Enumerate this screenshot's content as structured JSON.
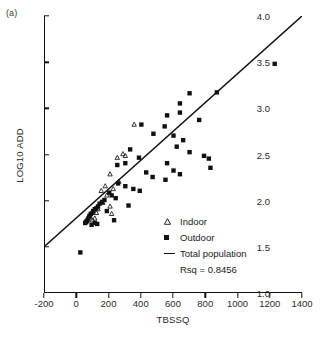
{
  "panel": {
    "label": "(a)"
  },
  "axes": {
    "xlabel": "TBSSQ",
    "ylabel": "LOG10 ADD",
    "xticks": [
      "-200",
      "0",
      "200",
      "400",
      "600",
      "800",
      "1000",
      "1200",
      "1400"
    ],
    "yticks": [
      "1.0",
      "1.5",
      "2.0",
      "2.5",
      "3.0",
      "3.5",
      "4.0"
    ]
  },
  "legend": {
    "indoor_label": "Indoor",
    "outdoor_label": "Outdoor",
    "total_label": "Total population",
    "rsq_label": "Rsq = 0.8456",
    "indoor_marker": "open-triangle-icon",
    "outdoor_marker": "filled-square-icon",
    "total_marker": "line-segment-icon"
  },
  "colors": {
    "axis": "#111111",
    "marker": "#111111",
    "background": "#ffffff"
  },
  "chart_data": {
    "type": "scatter",
    "title": "",
    "xlabel": "TBSSQ",
    "ylabel": "LOG10 ADD",
    "xlim": [
      -200,
      1400
    ],
    "ylim": [
      1.0,
      4.0
    ],
    "xticks": [
      -200,
      0,
      200,
      400,
      600,
      800,
      1000,
      1200,
      1400
    ],
    "yticks": [
      1.0,
      1.5,
      2.0,
      2.5,
      3.0,
      3.5,
      4.0
    ],
    "grid": false,
    "legend_position": "center-right",
    "annotations": [
      "(a)",
      "Rsq = 0.8456"
    ],
    "series": [
      {
        "name": "Indoor",
        "marker": "open-triangle",
        "points": [
          [
            355,
            2.82
          ],
          [
            250,
            2.46
          ],
          [
            285,
            2.5
          ],
          [
            300,
            2.48
          ],
          [
            205,
            2.28
          ],
          [
            175,
            2.15
          ],
          [
            260,
            2.2
          ],
          [
            225,
            2.12
          ],
          [
            150,
            2.1
          ],
          [
            185,
            2.05
          ],
          [
            160,
            1.97
          ],
          [
            205,
            1.93
          ],
          [
            130,
            1.9
          ],
          [
            120,
            1.86
          ],
          [
            215,
            1.85
          ],
          [
            110,
            1.8
          ],
          [
            95,
            1.78
          ]
        ]
      },
      {
        "name": "Outdoor",
        "marker": "filled-square",
        "points": [
          [
            1230,
            3.48
          ],
          [
            870,
            3.17
          ],
          [
            700,
            3.16
          ],
          [
            640,
            3.05
          ],
          [
            640,
            2.95
          ],
          [
            560,
            2.92
          ],
          [
            760,
            2.87
          ],
          [
            400,
            2.82
          ],
          [
            545,
            2.8
          ],
          [
            475,
            2.72
          ],
          [
            600,
            2.7
          ],
          [
            660,
            2.65
          ],
          [
            620,
            2.58
          ],
          [
            330,
            2.55
          ],
          [
            700,
            2.52
          ],
          [
            790,
            2.48
          ],
          [
            820,
            2.45
          ],
          [
            385,
            2.46
          ],
          [
            300,
            2.4
          ],
          [
            250,
            2.38
          ],
          [
            560,
            2.4
          ],
          [
            600,
            2.32
          ],
          [
            830,
            2.35
          ],
          [
            640,
            2.28
          ],
          [
            430,
            2.3
          ],
          [
            470,
            2.25
          ],
          [
            550,
            2.22
          ],
          [
            255,
            2.18
          ],
          [
            300,
            2.15
          ],
          [
            350,
            2.12
          ],
          [
            390,
            2.1
          ],
          [
            200,
            2.08
          ],
          [
            215,
            2.05
          ],
          [
            240,
            2.02
          ],
          [
            170,
            2.0
          ],
          [
            155,
            1.98
          ],
          [
            140,
            1.96
          ],
          [
            320,
            1.94
          ],
          [
            130,
            1.93
          ],
          [
            120,
            1.91
          ],
          [
            110,
            1.9
          ],
          [
            100,
            1.88
          ],
          [
            95,
            1.86
          ],
          [
            85,
            1.85
          ],
          [
            80,
            1.83
          ],
          [
            75,
            1.82
          ],
          [
            70,
            1.8
          ],
          [
            185,
            1.88
          ],
          [
            230,
            1.78
          ],
          [
            65,
            1.78
          ],
          [
            60,
            1.77
          ],
          [
            55,
            1.76
          ],
          [
            110,
            1.75
          ],
          [
            125,
            1.74
          ],
          [
            90,
            1.73
          ],
          [
            50,
            1.75
          ],
          [
            20,
            1.43
          ]
        ]
      }
    ],
    "fit_line": {
      "name": "Total population",
      "rsq": 0.8456,
      "endpoints": [
        [
          -200,
          1.5
        ],
        [
          1400,
          4.0
        ]
      ]
    }
  }
}
